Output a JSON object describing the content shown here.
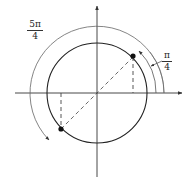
{
  "diagram": {
    "type": "unit-circle-angle",
    "center": [
      97,
      93
    ],
    "radius": 50,
    "axes": {
      "x": {
        "from": 15,
        "to": 182
      },
      "y": {
        "from": 6,
        "to": 177
      }
    },
    "points": [
      {
        "name": "point-pi-over-4",
        "x": 133,
        "y": 57
      },
      {
        "name": "point-5pi-over-4",
        "x": 61,
        "y": 129
      }
    ],
    "labels": {
      "five_pi_over_4": {
        "numerator": "5π",
        "denominator": "4"
      },
      "pi_over_4": {
        "numerator": "π",
        "denominator": "4"
      }
    },
    "colors": {
      "stroke": "#333333",
      "arc": "#555555"
    }
  }
}
